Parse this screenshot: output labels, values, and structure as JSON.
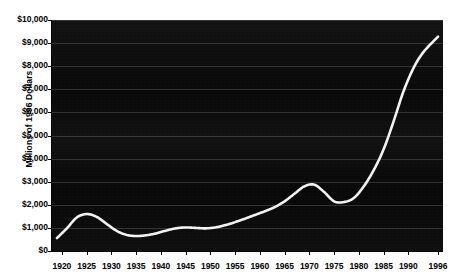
{
  "chart": {
    "type": "line",
    "title": "",
    "ylabel": "Millions of 1996 Dollars",
    "xlabel": "",
    "line_color": "#f2f2f2",
    "plot_background": "#0a0a0a",
    "grid": true,
    "legend": "none",
    "ylim": [
      0,
      10000
    ],
    "xlim": [
      1918,
      1997
    ],
    "ytick_labels": [
      "$10,000",
      "$9,000",
      "$8,000",
      "$7,000",
      "$6,000",
      "$5,000",
      "$4,000",
      "$3,000",
      "$2,000",
      "$1,000",
      "$0"
    ],
    "ytick_values": [
      10000,
      9000,
      8000,
      7000,
      6000,
      5000,
      4000,
      3000,
      2000,
      1000,
      0
    ],
    "xtick_labels": [
      "1920",
      "1925",
      "1930",
      "1935",
      "1940",
      "1945",
      "1950",
      "1955",
      "1960",
      "1965",
      "1970",
      "1975",
      "1980",
      "1985",
      "1990",
      "1996"
    ],
    "xtick_values": [
      1920,
      1925,
      1930,
      1935,
      1940,
      1945,
      1950,
      1955,
      1960,
      1965,
      1970,
      1975,
      1980,
      1985,
      1990,
      1996
    ]
  },
  "chart_data": {
    "type": "line",
    "title": "",
    "xlabel": "",
    "ylabel": "Millions of 1996 Dollars",
    "ylim": [
      0,
      10000
    ],
    "xlim": [
      1918,
      1997
    ],
    "grid": true,
    "legend": "none",
    "series": [
      {
        "name": "Millions of 1996 Dollars",
        "color": "#f2f2f2",
        "x": [
          1919,
          1921,
          1923,
          1925,
          1927,
          1929,
          1931,
          1933,
          1935,
          1937,
          1939,
          1941,
          1943,
          1945,
          1947,
          1949,
          1951,
          1953,
          1955,
          1957,
          1959,
          1961,
          1963,
          1965,
          1967,
          1969,
          1971,
          1973,
          1975,
          1977,
          1979,
          1981,
          1983,
          1985,
          1987,
          1989,
          1991,
          1993,
          1996
        ],
        "values": [
          560,
          980,
          1450,
          1600,
          1480,
          1180,
          880,
          700,
          650,
          680,
          760,
          880,
          980,
          1020,
          1000,
          980,
          1020,
          1120,
          1250,
          1400,
          1560,
          1720,
          1900,
          2150,
          2480,
          2800,
          2870,
          2550,
          2150,
          2120,
          2300,
          2800,
          3500,
          4400,
          5600,
          6900,
          7900,
          8600,
          9280
        ]
      }
    ]
  }
}
